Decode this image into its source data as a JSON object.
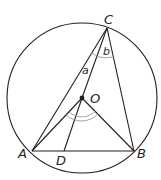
{
  "figure": {
    "type": "circle-geometry",
    "colors": {
      "stroke": "#231f20",
      "angle_arc": "#9a9a9a",
      "background": "#ffffff"
    },
    "circle": {
      "center_label": "O"
    },
    "points": [
      {
        "id": "A",
        "label": "A"
      },
      {
        "id": "B",
        "label": "B"
      },
      {
        "id": "C",
        "label": "C"
      },
      {
        "id": "D",
        "label": "D"
      },
      {
        "id": "O",
        "label": "O"
      }
    ],
    "segments": [
      "AB",
      "AC",
      "BC",
      "CO",
      "OA",
      "OB",
      "OD"
    ],
    "angles": [
      {
        "label": "a",
        "between": "AC, CO"
      },
      {
        "label": "b",
        "between": "OC, CB"
      },
      {
        "label": "",
        "at": "O",
        "between": "OA, OB",
        "marks": 2
      }
    ]
  }
}
